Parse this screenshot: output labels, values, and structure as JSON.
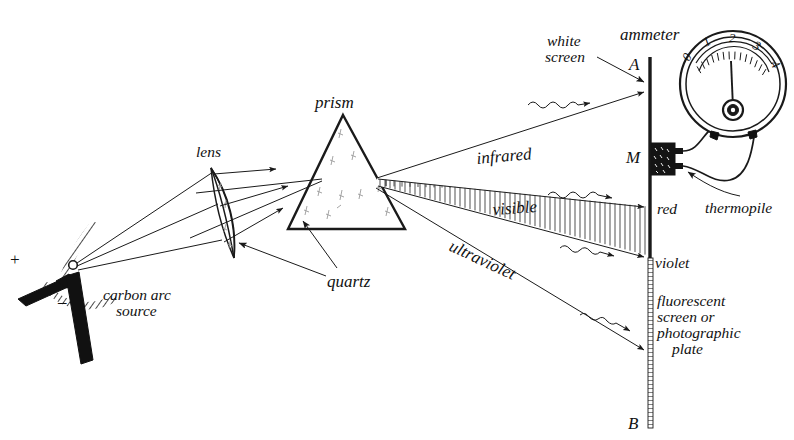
{
  "figure": {
    "domain_hint": "scientific line diagram, hand-drawn pen-and-ink style",
    "background_color": "#ffffff",
    "ink_color": "#1a1a1a"
  },
  "labels": {
    "source_plus": "+",
    "source_minus": "–",
    "carbon_arc_source": "carbon arc\nsource",
    "carbon_arc_source_line1": "carbon arc",
    "carbon_arc_source_line2": "source",
    "lens": "lens",
    "quartz": "quartz",
    "prism": "prism",
    "infrared": "infrared",
    "visible": "visible",
    "ultraviolet": "ultraviolet",
    "white_screen_line1": "white",
    "white_screen_line2": "screen",
    "ammeter": "ammeter",
    "thermopile": "thermopile",
    "red": "red",
    "violet": "violet",
    "point_a": "A",
    "point_b": "B",
    "point_m": "M",
    "fluorescent_line1": "fluorescent",
    "fluorescent_line2": "screen or",
    "fluorescent_line3": "photographic",
    "fluorescent_line4": "plate"
  },
  "ammeter": {
    "scale_ticks": [
      "0",
      "1",
      "2",
      "3",
      "4"
    ],
    "needle_value": "2",
    "dial_min": 0,
    "dial_max": 4
  },
  "components": [
    {
      "name": "carbon-arc-source",
      "label": "carbon arc source"
    },
    {
      "name": "quartz-lens",
      "label": "lens"
    },
    {
      "name": "quartz-prism",
      "label": "prism"
    },
    {
      "name": "white-screen",
      "label": "white screen"
    },
    {
      "name": "thermopile",
      "label": "thermopile"
    },
    {
      "name": "ammeter",
      "label": "ammeter"
    },
    {
      "name": "fluorescent-screen",
      "label": "fluorescent screen or photographic plate"
    }
  ],
  "spectrum_bands": [
    {
      "name": "infrared",
      "label": "infrared",
      "target": "A",
      "hatched": false
    },
    {
      "name": "visible",
      "label": "visible",
      "target": "red-to-violet",
      "hatched": true
    },
    {
      "name": "ultraviolet",
      "label": "ultraviolet",
      "target": "B",
      "hatched": false
    }
  ]
}
